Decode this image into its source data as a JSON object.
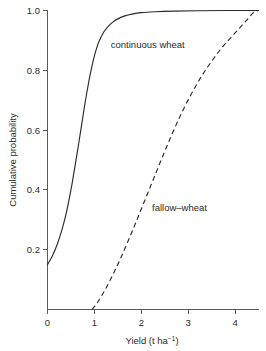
{
  "chart_data": {
    "type": "line",
    "title": "",
    "xlabel": "Yield (t ha⁻¹)",
    "ylabel": "Cumulative probability",
    "xlim": [
      0,
      4.5
    ],
    "ylim": [
      0,
      1.0
    ],
    "grid": false,
    "legend_position": "inline-annotation",
    "xticks": [
      0,
      1,
      2,
      3,
      4
    ],
    "xtick_labels": [
      "0",
      "1",
      "2",
      "3",
      "4"
    ],
    "yticks": [
      0.2,
      0.4,
      0.6,
      0.8,
      1.0
    ],
    "ytick_labels": [
      "0.2",
      "0.4",
      "0.6",
      "0.8",
      "1.0"
    ],
    "series": [
      {
        "name": "continuous wheat",
        "style": "solid",
        "annotation": "continuous wheat",
        "annotation_x": 1.35,
        "annotation_y": 0.885,
        "x": [
          0.0,
          0.1,
          0.2,
          0.3,
          0.4,
          0.5,
          0.55,
          0.6,
          0.65,
          0.7,
          0.75,
          0.8,
          0.85,
          0.9,
          0.95,
          1.0,
          1.05,
          1.1,
          1.2,
          1.3,
          1.4,
          1.5,
          1.65,
          1.8,
          2.0,
          2.3,
          2.7,
          3.2,
          3.8,
          4.5
        ],
        "y": [
          0.15,
          0.178,
          0.215,
          0.262,
          0.322,
          0.4,
          0.445,
          0.492,
          0.54,
          0.59,
          0.64,
          0.69,
          0.735,
          0.778,
          0.815,
          0.848,
          0.875,
          0.897,
          0.928,
          0.948,
          0.962,
          0.972,
          0.982,
          0.988,
          0.993,
          0.996,
          0.998,
          0.999,
          1.0,
          1.0
        ]
      },
      {
        "name": "fallow-wheat",
        "style": "dashed",
        "annotation": "fallow–wheat",
        "annotation_x": 2.23,
        "annotation_y": 0.34,
        "x": [
          0.95,
          1.05,
          1.15,
          1.25,
          1.4,
          1.55,
          1.7,
          1.85,
          2.0,
          2.15,
          2.3,
          2.45,
          2.6,
          2.75,
          2.9,
          3.05,
          3.2,
          3.35,
          3.5,
          3.65,
          3.8,
          3.95,
          4.1,
          4.25,
          4.4,
          4.5
        ],
        "y": [
          0.0,
          0.02,
          0.045,
          0.072,
          0.118,
          0.168,
          0.222,
          0.278,
          0.336,
          0.394,
          0.452,
          0.51,
          0.566,
          0.62,
          0.67,
          0.716,
          0.758,
          0.796,
          0.83,
          0.862,
          0.89,
          0.916,
          0.942,
          0.968,
          0.994,
          1.0
        ]
      }
    ]
  },
  "axis_titles": {
    "x_main": "Yield (t ha",
    "x_sup": "−1",
    "x_tail": ")",
    "y": "Cumulative probability"
  }
}
